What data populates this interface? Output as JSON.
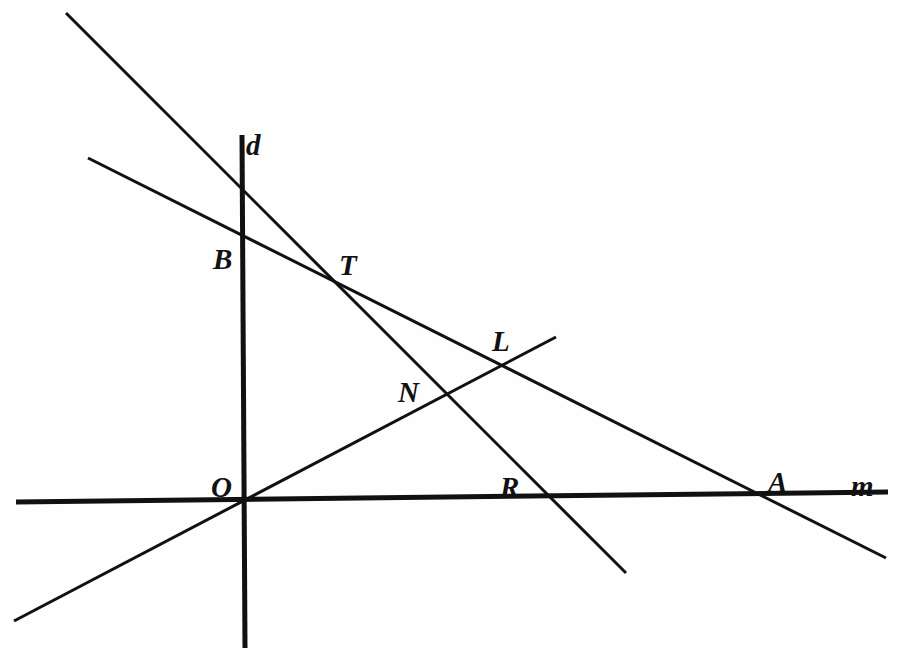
{
  "figure": {
    "width": 899,
    "height": 660,
    "background_color": "#fefefe",
    "ink_color": "#111111"
  },
  "labels": [
    {
      "id": "d",
      "text": "d",
      "x": 246,
      "y": 131,
      "size": 29,
      "note": "name of the vertical line"
    },
    {
      "id": "B",
      "text": "B",
      "x": 213,
      "y": 245,
      "size": 29,
      "note": "point where shallow descending line meets line d"
    },
    {
      "id": "T",
      "text": "T",
      "x": 339,
      "y": 251,
      "size": 29,
      "note": "intersection of the two descending lines"
    },
    {
      "id": "L",
      "text": "L",
      "x": 492,
      "y": 327,
      "size": 29,
      "note": "intersection of rising line and shallow descending line"
    },
    {
      "id": "N",
      "text": "N",
      "x": 398,
      "y": 378,
      "size": 29,
      "note": "intersection of rising line and steep descending line"
    },
    {
      "id": "O",
      "text": "O",
      "x": 211,
      "y": 473,
      "size": 29,
      "note": "origin: line d meets line m and the rising line"
    },
    {
      "id": "R",
      "text": "R",
      "x": 500,
      "y": 473,
      "size": 29,
      "note": "point on line m left of the steep line crossing"
    },
    {
      "id": "A",
      "text": "A",
      "x": 768,
      "y": 468,
      "size": 29,
      "note": "intersection of shallow descending line and line m"
    },
    {
      "id": "m",
      "text": "m",
      "x": 851,
      "y": 472,
      "size": 29,
      "note": "name of the horizontal line"
    }
  ],
  "lines": [
    {
      "id": "line-m-horizontal",
      "name": "m",
      "x1": 16,
      "y1": 502,
      "x2": 888,
      "y2": 492,
      "width": 5,
      "note": "horizontal base line labelled m"
    },
    {
      "id": "line-d-vertical",
      "name": "d",
      "x1": 242,
      "y1": 135,
      "x2": 245,
      "y2": 648,
      "width": 5,
      "note": "vertical line labelled d through O"
    },
    {
      "id": "line-steep-descending",
      "name": "steep descending line through B-region, T, N and m",
      "x1": 66,
      "y1": 13,
      "x2": 626,
      "y2": 573,
      "width": 3,
      "note": "passes the vertical line high, crosses T, N, then m near R"
    },
    {
      "id": "line-shallow-descending",
      "name": "shallow descending line through B, T, L and A",
      "x1": 88,
      "y1": 158,
      "x2": 886,
      "y2": 558,
      "width": 3,
      "note": "crosses line d at B, meets the steep line at T, crosses rising line at L, meets m at A"
    },
    {
      "id": "line-rising",
      "name": "rising line through O, N and L",
      "x1": 14,
      "y1": 621,
      "x2": 556,
      "y2": 337,
      "width": 3,
      "note": "rises from lower left through the origin O, then N, ending just past L"
    }
  ]
}
